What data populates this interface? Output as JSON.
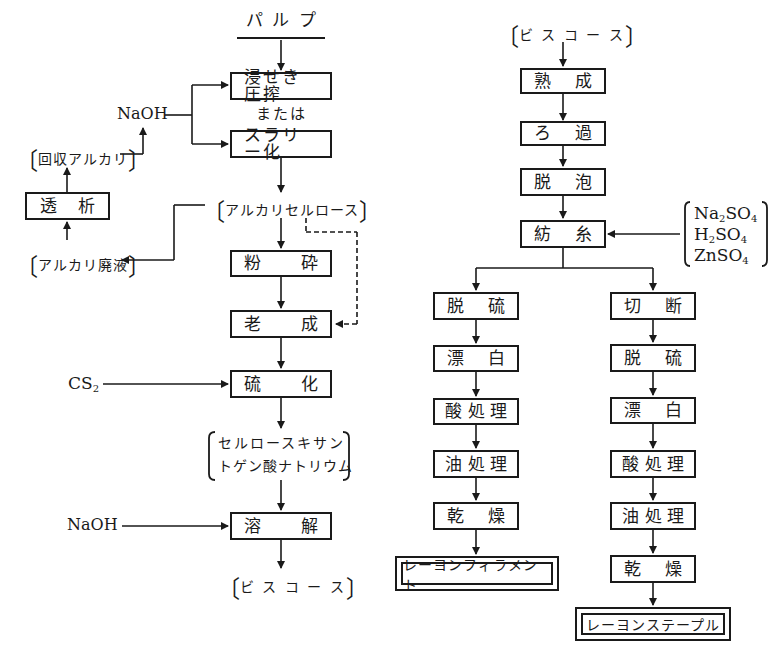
{
  "diagram": {
    "type": "flowchart",
    "left_flow": {
      "start": "パ ル プ",
      "steps": [
        {
          "id": "steeping",
          "label_a": "浸せき圧搾",
          "label_b": ""
        },
        {
          "id": "or",
          "label": "または"
        },
        {
          "id": "slurry",
          "label_a": "スラリー化",
          "label_b": ""
        },
        {
          "id": "alkali_cellulose",
          "label": "アルカリセルロース"
        },
        {
          "id": "crushing",
          "label_a": "粉",
          "label_b": "砕"
        },
        {
          "id": "aging",
          "label_a": "老",
          "label_b": "成"
        },
        {
          "id": "xanthation",
          "label_a": "硫",
          "label_b": "化"
        },
        {
          "id": "xanthate_line1",
          "label": "セルロースキサン"
        },
        {
          "id": "xanthate_line2",
          "label": "トゲン酸ナトリウム"
        },
        {
          "id": "dissolving",
          "label_a": "溶",
          "label_b": "解"
        },
        {
          "id": "viscose_out",
          "label": "ビ ス コ ー ス"
        }
      ],
      "inputs": {
        "naoh_top": "NaOH",
        "recovered_alkali": "回収アルカリ",
        "dialysis_a": "透",
        "dialysis_b": "析",
        "waste_alkali": "アルカリ廃液",
        "cs2": "CS",
        "cs2_sub": "2",
        "naoh_bottom": "NaOH"
      }
    },
    "right_flow": {
      "start": "ビ ス コ ー ス",
      "steps": [
        {
          "id": "ripening",
          "label_a": "熟",
          "label_b": "成"
        },
        {
          "id": "filtration",
          "label_a": "ろ",
          "label_b": "過"
        },
        {
          "id": "defoaming",
          "label_a": "脱",
          "label_b": "泡"
        },
        {
          "id": "spinning",
          "label_a": "紡",
          "label_b": "糸"
        }
      ],
      "spin_bath": [
        {
          "a": "Na",
          "sub1": "2",
          "b": "SO",
          "sub2": "4"
        },
        {
          "a": "H",
          "sub1": "2",
          "b": "SO",
          "sub2": "4"
        },
        {
          "a": "ZnSO",
          "sub1": "4",
          "b": "",
          "sub2": ""
        }
      ],
      "filament_branch": {
        "steps": [
          {
            "label_a": "脱",
            "label_b": "硫"
          },
          {
            "label_a": "漂",
            "label_b": "白"
          },
          {
            "label_a": "酸",
            "label_m": "処",
            "label_b": "理"
          },
          {
            "label_a": "油",
            "label_m": "処",
            "label_b": "理"
          },
          {
            "label_a": "乾",
            "label_b": "燥"
          }
        ],
        "product": "レーヨンフィラメント"
      },
      "staple_branch": {
        "steps": [
          {
            "label_a": "切",
            "label_b": "断"
          },
          {
            "label_a": "脱",
            "label_b": "硫"
          },
          {
            "label_a": "漂",
            "label_b": "白"
          },
          {
            "label_a": "酸",
            "label_m": "処",
            "label_b": "理"
          },
          {
            "label_a": "油",
            "label_m": "処",
            "label_b": "理"
          },
          {
            "label_a": "乾",
            "label_b": "燥"
          }
        ],
        "product": "レーヨンステープル"
      }
    },
    "colors": {
      "ink": "#1a1a1a",
      "background": "#ffffff"
    }
  }
}
